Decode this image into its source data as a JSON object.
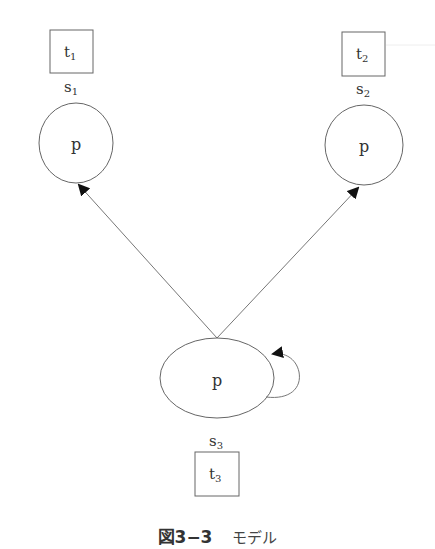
{
  "diagram": {
    "type": "state-model",
    "nodes": [
      {
        "id": "s1",
        "state_label": "s",
        "state_sub": "1",
        "node_label": "p",
        "box_label": "t",
        "box_sub": "1"
      },
      {
        "id": "s2",
        "state_label": "s",
        "state_sub": "2",
        "node_label": "p",
        "box_label": "t",
        "box_sub": "2"
      },
      {
        "id": "s3",
        "state_label": "s",
        "state_sub": "3",
        "node_label": "p",
        "box_label": "t",
        "box_sub": "3"
      }
    ],
    "edges": [
      {
        "from": "s3",
        "to": "s1"
      },
      {
        "from": "s3",
        "to": "s2"
      },
      {
        "from": "s3",
        "to": "s3",
        "self_loop": true
      }
    ],
    "colors": {
      "stroke": "#555555",
      "text": "#333333",
      "arrow": "#111111"
    }
  },
  "caption": {
    "number": "図3−3",
    "text": "モデル"
  }
}
